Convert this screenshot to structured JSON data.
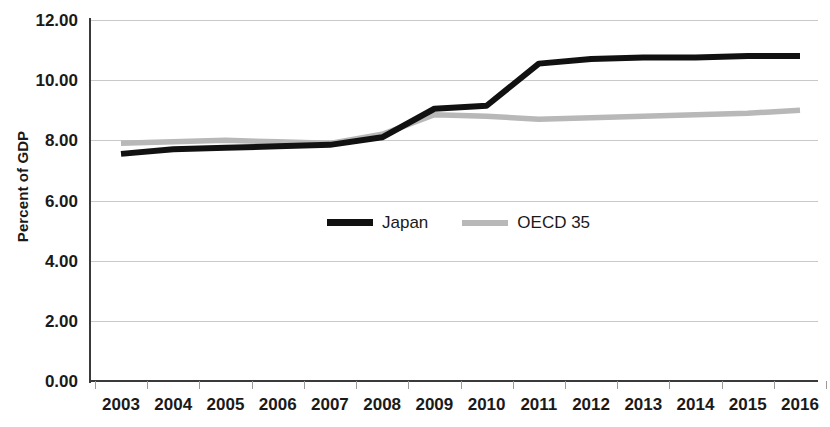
{
  "chart_data": {
    "type": "line",
    "title": "",
    "subtitle": "",
    "xlabel": "",
    "ylabel": "Percent of GDP",
    "categories": [
      "2003",
      "2004",
      "2005",
      "2006",
      "2007",
      "2008",
      "2009",
      "2010",
      "2011",
      "2012",
      "2013",
      "2014",
      "2015",
      "2016"
    ],
    "series": [
      {
        "name": "Japan",
        "color": "#111111",
        "values": [
          7.55,
          7.7,
          7.75,
          7.8,
          7.85,
          8.1,
          9.05,
          9.15,
          10.55,
          10.7,
          10.75,
          10.75,
          10.8,
          10.8
        ]
      },
      {
        "name": "OECD 35",
        "color": "#b8b8b8",
        "values": [
          7.9,
          7.95,
          8.0,
          7.95,
          7.9,
          8.2,
          8.85,
          8.8,
          8.7,
          8.75,
          8.8,
          8.85,
          8.9,
          9.0
        ]
      }
    ],
    "ylim": [
      0,
      12
    ],
    "ytick_step": 2,
    "ytick_labels": [
      "12.00",
      "10.00",
      "8.00",
      "6.00",
      "4.00",
      "2.00",
      "0.00"
    ],
    "ytick_values": [
      12,
      10,
      8,
      6,
      4,
      2,
      0
    ],
    "grid": "horizontal",
    "legend_position": "inside-center",
    "axis_color": "#3a3a3a",
    "grid_color": "#c9c9c9"
  },
  "legend": {
    "items": [
      {
        "label": "Japan",
        "color": "#111111"
      },
      {
        "label": "OECD 35",
        "color": "#b8b8b8"
      }
    ]
  }
}
